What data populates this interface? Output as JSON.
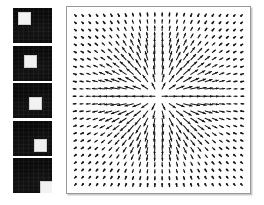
{
  "figure": {
    "background_color": "#ffffff"
  },
  "filmstrip": {
    "label": "Input image sequence",
    "frame_count": 5,
    "frame_background_color": "#0b0b0b",
    "object_color": "#f2f2f2",
    "object_label": "moving-square",
    "frames": [
      {
        "index": 1,
        "caption": "frame 1",
        "object_x_pct": 14,
        "object_y_pct": 12
      },
      {
        "index": 2,
        "caption": "frame 2",
        "object_x_pct": 27,
        "object_y_pct": 27
      },
      {
        "index": 3,
        "caption": "frame 3",
        "object_x_pct": 41,
        "object_y_pct": 41
      },
      {
        "index": 4,
        "caption": "frame 4",
        "object_x_pct": 54,
        "object_y_pct": 54
      },
      {
        "index": 5,
        "caption": "frame 5",
        "object_x_pct": 68,
        "object_y_pct": 66
      }
    ]
  },
  "flow_panel": {
    "label": "Estimated flow field",
    "border_color": "#9a9a9a",
    "arrow_color": "#151515",
    "background_color": "#ffffff"
  },
  "chart_data": {
    "type": "quiver",
    "title": "",
    "xlabel": "",
    "ylabel": "",
    "grid": false,
    "legend": null,
    "grid_cols": 24,
    "grid_rows": 24,
    "xlim": [
      0,
      24
    ],
    "ylim": [
      0,
      24
    ],
    "center": [
      11.5,
      11.0
    ],
    "max_arrow_length_px": 9.0,
    "background_arrow_length_px": 1.6,
    "field_model": "outward radial divergence from center, magnitude peaks in a ring around the center and decays to near-zero dots at the borders"
  }
}
